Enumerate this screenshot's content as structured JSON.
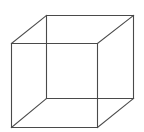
{
  "figure": {
    "type": "necker-cube",
    "background": "#ffffff",
    "stroke": "#4a4a4a",
    "stroke_width": 1.1,
    "vertices": {
      "front_top_left": [
        11,
        43
      ],
      "front_top_right": [
        97,
        43
      ],
      "front_bottom_left": [
        11,
        127
      ],
      "front_bottom_right": [
        97,
        127
      ],
      "back_top_left": [
        46,
        15
      ],
      "back_top_right": [
        133,
        15
      ],
      "back_bottom_left": [
        46,
        98
      ],
      "back_bottom_right": [
        133,
        98
      ]
    },
    "edges": [
      [
        "front_top_left",
        "front_top_right"
      ],
      [
        "front_top_right",
        "front_bottom_right"
      ],
      [
        "front_bottom_right",
        "front_bottom_left"
      ],
      [
        "front_bottom_left",
        "front_top_left"
      ],
      [
        "back_top_left",
        "back_top_right"
      ],
      [
        "back_top_right",
        "back_bottom_right"
      ],
      [
        "back_bottom_right",
        "back_bottom_left"
      ],
      [
        "back_bottom_left",
        "back_top_left"
      ],
      [
        "front_top_left",
        "back_top_left"
      ],
      [
        "front_top_right",
        "back_top_right"
      ],
      [
        "front_bottom_left",
        "back_bottom_left"
      ],
      [
        "front_bottom_right",
        "back_bottom_right"
      ]
    ]
  }
}
